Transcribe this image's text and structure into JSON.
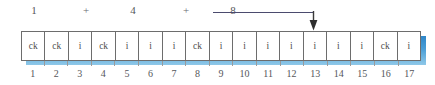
{
  "diagram": {
    "title_row": {
      "items": [
        {
          "kind": "value",
          "label": "1",
          "x": 23
        },
        {
          "kind": "plus",
          "label": "+",
          "x": 75
        },
        {
          "kind": "value",
          "label": "4",
          "x": 122
        },
        {
          "kind": "plus",
          "label": "+",
          "x": 175
        },
        {
          "kind": "value",
          "label": "8",
          "x": 222
        }
      ]
    },
    "pointer": {
      "line_label": "pointer-line",
      "arrow_label": "down-arrow",
      "target_index": "13",
      "arrow_color": "#3a3a3a",
      "line_color": "#4b4b6e"
    },
    "strip": {
      "cells": [
        {
          "index": "1",
          "label": "ck"
        },
        {
          "index": "2",
          "label": "ck"
        },
        {
          "index": "3",
          "label": "i"
        },
        {
          "index": "4",
          "label": "ck"
        },
        {
          "index": "5",
          "label": "i"
        },
        {
          "index": "6",
          "label": "i"
        },
        {
          "index": "7",
          "label": "i"
        },
        {
          "index": "8",
          "label": "ck"
        },
        {
          "index": "9",
          "label": "i"
        },
        {
          "index": "10",
          "label": "i"
        },
        {
          "index": "11",
          "label": "i"
        },
        {
          "index": "12",
          "label": "i"
        },
        {
          "index": "13",
          "label": "i"
        },
        {
          "index": "14",
          "label": "i"
        },
        {
          "index": "15",
          "label": "i"
        },
        {
          "index": "16",
          "label": "ck"
        },
        {
          "index": "17",
          "label": "i"
        }
      ],
      "shadow_color": "#3b8ecc",
      "border_color": "#6d6d6d"
    }
  }
}
